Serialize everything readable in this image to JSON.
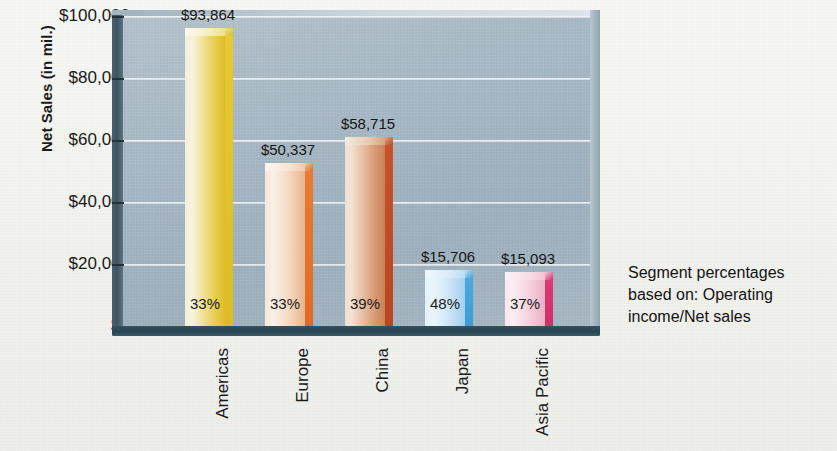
{
  "chart_data": {
    "type": "bar",
    "title": "",
    "xlabel": "",
    "ylabel": "Net Sales (in mil.)",
    "ylim": [
      0,
      100000
    ],
    "grid": true,
    "legend": "none",
    "categories": [
      "Americas",
      "Europe",
      "China",
      "Japan",
      "Asia Pacific"
    ],
    "values": [
      93864,
      50337,
      58715,
      15706,
      15093
    ],
    "value_labels": [
      "$93,864",
      "$50,337",
      "$58,715",
      "$15,706",
      "$15,093"
    ],
    "secondary_labels": [
      "33%",
      "33%",
      "39%",
      "48%",
      "37%"
    ],
    "secondary_values": [
      33,
      33,
      39,
      48,
      37
    ],
    "secondary_label_meaning": "Operating income/Net sales",
    "ytick_labels": [
      "$100,000",
      "$80,000",
      "$60,000",
      "$40,000",
      "$20,000",
      "$0"
    ],
    "ytick_values": [
      100000,
      80000,
      60000,
      40000,
      20000,
      0
    ],
    "annotation_lines": [
      "Segment percentages",
      "based on: Operating",
      "income/Net sales"
    ],
    "series": [
      {
        "name": "Net Sales (in mil.)",
        "values": [
          93864,
          50337,
          58715,
          15706,
          15093
        ]
      }
    ],
    "colors": {
      "plot_background": "#a9bac6",
      "base_platform": "#2b4453",
      "left_wall": "#3d5463",
      "gridline": "#ffffff",
      "americas": "#e3c43a",
      "europe": "#e8733a",
      "china": "#c2552c",
      "japan": "#49a9e0",
      "asia_pacific": "#dd3b70"
    }
  },
  "bars": [
    {
      "category": "Americas",
      "value_label": "$93,864",
      "pct_label": "33%",
      "face_gradient": "linear-gradient(90deg,#f5efd7 0%,#f8f3e2 18%,#efe08f 48%,#e6cb4a 78%,#ddbd2c 100%)",
      "side_gradient": "linear-gradient(180deg,#e9c82f 0%,#dcbb24 100%)",
      "top_gradient": "linear-gradient(90deg,#fdfaed 0%,#f7efc9 55%,#eedf92 100%)",
      "top_side_gradient": "linear-gradient(135deg,#f0e198 0%,#dcbb24 100%)"
    },
    {
      "category": "Europe",
      "value_label": "$50,337",
      "pct_label": "33%",
      "face_gradient": "linear-gradient(90deg,#f7e7da 0%,#fbf0e5 20%,#f6ddc7 55%,#eec5a3 82%,#e8b48c 100%)",
      "side_gradient": "linear-gradient(180deg,#ea7a34 0%,#df6a26 100%)",
      "top_gradient": "linear-gradient(90deg,#fdf6ef 0%,#f8e5d4 60%,#eecaab 100%)",
      "top_side_gradient": "linear-gradient(135deg,#f3c29c 0%,#e06d28 100%)"
    },
    {
      "category": "China",
      "value_label": "$58,715",
      "pct_label": "39%",
      "face_gradient": "linear-gradient(90deg,#efe0d5 0%,#f3e3d6 14%,#e5bfa2 45%,#d79a74 75%,#cc8056 100%)",
      "side_gradient": "linear-gradient(180deg,#c8512a 0%,#ba4520 100%)",
      "top_gradient": "linear-gradient(90deg,#f6ece3 0%,#e8cab2 58%,#d9a37e 100%)",
      "top_side_gradient": "linear-gradient(135deg,#dda580 0%,#bc4821 100%)"
    },
    {
      "category": "Japan",
      "value_label": "$15,706",
      "pct_label": "48%",
      "face_gradient": "linear-gradient(90deg,#e3f1f9 0%,#eaf5fb 22%,#cfe7f6 58%,#b2d8f1 85%,#a2d0ef 100%)",
      "side_gradient": "linear-gradient(180deg,#4aa9e2 0%,#3c9cd8 100%)",
      "top_gradient": "linear-gradient(90deg,#f1f8fd 0%,#d9ecf8 60%,#bcdef3 100%)",
      "top_side_gradient": "linear-gradient(135deg,#bfe0f4 0%,#3f9fda 100%)"
    },
    {
      "category": "Asia Pacific",
      "value_label": "$15,093",
      "pct_label": "37%",
      "face_gradient": "linear-gradient(90deg,#f9e6ec 0%,#fbeef2 20%,#f6d5e0 55%,#f0bdcf 84%,#ecafc5 100%)",
      "side_gradient": "linear-gradient(180deg,#dd3b70 0%,#d02f63 100%)",
      "top_gradient": "linear-gradient(90deg,#fdf2f6 0%,#f7dde6 60%,#f1c4d4 100%)",
      "top_side_gradient": "linear-gradient(135deg,#f2c6d6 0%,#d43366 100%)"
    }
  ]
}
